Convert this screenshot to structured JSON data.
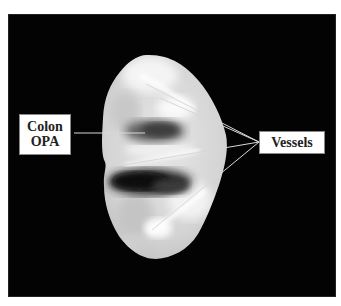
{
  "figure": {
    "labels": {
      "colon_opa_line1": "Colon",
      "colon_opa_line2": "OPA",
      "vessels": "Vessels"
    },
    "colors": {
      "background": "#030303",
      "page": "#ffffff",
      "label_text": "#222222",
      "pointer_lines": "#d8d8d8"
    }
  }
}
